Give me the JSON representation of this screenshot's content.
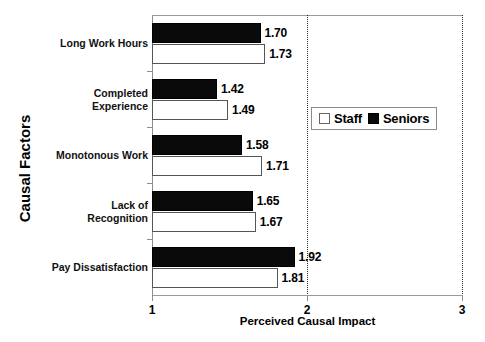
{
  "chart_data": {
    "type": "bar",
    "orientation": "horizontal",
    "title": "",
    "xlabel": "Perceived Causal Impact",
    "ylabel": "Causal Factors",
    "xlim": [
      1,
      3
    ],
    "xticks": [
      "1",
      "2",
      "3"
    ],
    "grid": "vertical-dotted",
    "legend_position": "center-right",
    "categories": [
      "Long Work Hours",
      "Completed Experience",
      "Monotonous Work",
      "Lack of Recognition",
      "Pay Dissatisfaction"
    ],
    "category_lines": [
      [
        "Long Work Hours"
      ],
      [
        "Completed",
        "Experience"
      ],
      [
        "Monotonous Work"
      ],
      [
        "Lack of",
        "Recognition"
      ],
      [
        "Pay Dissatisfaction"
      ]
    ],
    "series": [
      {
        "name": "Seniors",
        "color": "#0a0a0a",
        "values": [
          1.7,
          1.42,
          1.58,
          1.65,
          1.92
        ],
        "labels": [
          "1.70",
          "1.42",
          "1.58",
          "1.65",
          "1.92"
        ]
      },
      {
        "name": "Staff",
        "color": "#ffffff",
        "values": [
          1.73,
          1.49,
          1.71,
          1.67,
          1.81
        ],
        "labels": [
          "1.73",
          "1.49",
          "1.71",
          "1.67",
          "1.81"
        ]
      }
    ]
  },
  "legend": {
    "entries": [
      {
        "label": "Staff",
        "swatch": "hollow-square"
      },
      {
        "label": "Seniors",
        "swatch": "filled-square"
      }
    ]
  },
  "axes": {
    "x_title": "Perceived Causal Impact",
    "y_title": "Causal Factors",
    "x_tick_labels": [
      "1",
      "2",
      "3"
    ]
  }
}
